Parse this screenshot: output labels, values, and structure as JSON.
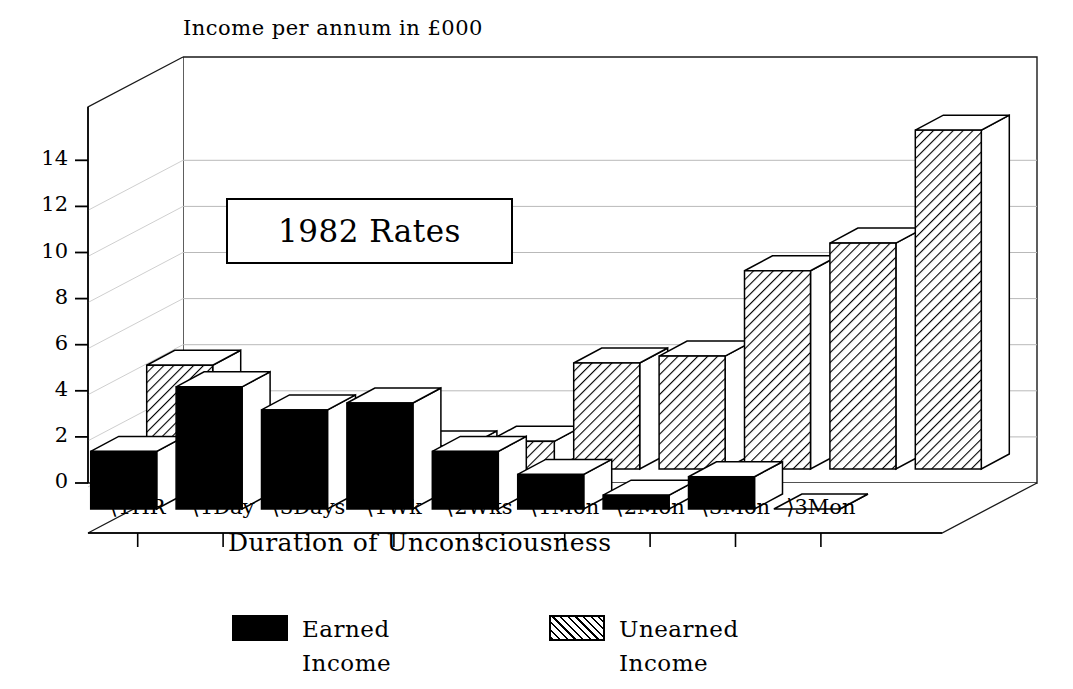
{
  "chart_data": {
    "type": "bar",
    "title": "Income per annum in £000",
    "xlabel": "Duration of Unconsciousness",
    "ylabel": "",
    "annotation": "1982 Rates",
    "categories": [
      "⟨1HR",
      "⟨1Day",
      "⟨3Days",
      "⟨1Wk",
      "⟨2Wks",
      "⟨1Mon",
      "⟨2Mon",
      "⟨3Mon",
      "⟩3Mon"
    ],
    "series": [
      {
        "name": "Earned Income",
        "fill": "solid",
        "color": "#000000",
        "values": [
          2.5,
          5.3,
          4.3,
          4.6,
          2.5,
          1.5,
          0.6,
          1.4,
          0.0
        ]
      },
      {
        "name": "Unearned Income",
        "fill": "hatch",
        "color": "#000000",
        "values": [
          4.5,
          1.1,
          1.0,
          1.0,
          1.2,
          4.6,
          4.9,
          8.6,
          9.8
        ]
      }
    ],
    "note_tall_bars": [
      8.6,
      9.8,
      14.7
    ],
    "yticks": [
      0,
      2,
      4,
      6,
      8,
      10,
      12,
      14
    ],
    "ylim": [
      0,
      15.6
    ],
    "grid": true,
    "legend_position": "bottom",
    "projection": "3d-two-row",
    "back_row_values": [
      4.5,
      1.1,
      1.0,
      1.0,
      1.2,
      4.6,
      4.9,
      8.6,
      9.8,
      14.7
    ],
    "front_row_values": [
      2.5,
      5.3,
      4.3,
      4.6,
      2.5,
      1.5,
      0.6,
      1.4,
      0.0
    ]
  },
  "legend": {
    "items": [
      {
        "label": "Earned Income"
      },
      {
        "label": "Unearned Income"
      }
    ]
  },
  "yticklabels": [
    "14",
    "12",
    "10",
    "8",
    "6",
    "4",
    "2",
    "0"
  ]
}
